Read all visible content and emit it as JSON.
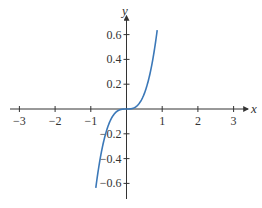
{
  "chart_data": {
    "type": "line",
    "title": "",
    "xlabel": "x",
    "ylabel": "y",
    "function": "y = x^3",
    "xlim": [
      -3.3,
      3.4
    ],
    "ylim": [
      -0.72,
      0.72
    ],
    "x_ticks": [
      -3,
      -2,
      -1,
      1,
      2,
      3
    ],
    "x_tick_labels": [
      "−3",
      "−2",
      "−1",
      "1",
      "2",
      "3"
    ],
    "y_ticks": [
      0.6,
      0.4,
      0.2,
      -0.2,
      -0.4,
      -0.6
    ],
    "y_tick_labels": [
      "0.6",
      "0.4",
      "0.2",
      "−0.2",
      "−0.4",
      "−0.6"
    ],
    "grid": false,
    "legend": null,
    "series": [
      {
        "name": "y = x^3",
        "color": "#3b78b8",
        "x": [
          -0.86,
          -0.8,
          -0.7,
          -0.6,
          -0.5,
          -0.4,
          -0.3,
          -0.2,
          -0.1,
          0,
          0.1,
          0.2,
          0.3,
          0.4,
          0.5,
          0.6,
          0.7,
          0.8,
          0.86
        ],
        "y": [
          -0.636,
          -0.512,
          -0.343,
          -0.216,
          -0.125,
          -0.064,
          -0.027,
          -0.008,
          -0.001,
          0,
          0.001,
          0.008,
          0.027,
          0.064,
          0.125,
          0.216,
          0.343,
          0.512,
          0.636
        ]
      }
    ]
  },
  "colors": {
    "axis": "#333333",
    "curve": "#3b78b8"
  }
}
